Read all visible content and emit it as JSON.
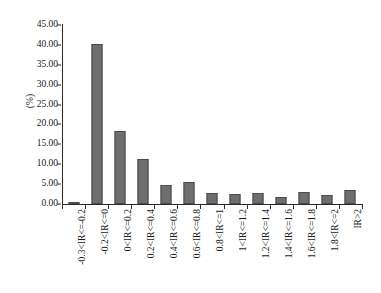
{
  "chart_data": {
    "type": "bar",
    "title": "",
    "subtitle": "",
    "xlabel": "",
    "ylabel": "(%)",
    "ylim": [
      0,
      45
    ],
    "yticks": [
      "0.00",
      "5.00",
      "10.00",
      "15.00",
      "20.00",
      "25.00",
      "30.00",
      "35.00",
      "40.00",
      "45.00"
    ],
    "ytick_values": [
      0,
      5,
      10,
      15,
      20,
      25,
      30,
      35,
      40,
      45
    ],
    "grid": false,
    "legend": "none",
    "bar_color": "#6e6e6e",
    "bar_edge_color": "#4a4a4a",
    "axis_color": "#2b2b2b",
    "categories": [
      "-0.3<IR<=-0.2",
      "-0.2<IR<=0",
      "0<IR<=0.2",
      "0.2<IR<=0.4",
      "0.4<IR<=0.6",
      "0.6<IR<=0.8",
      "0.8<IR<=1",
      "1<IR<=1.2",
      "1.2<IR<=1.4",
      "1.4<IR<=1.6",
      "1.6<IR<=1.8",
      "1.8<IR<=2",
      "IR>2"
    ],
    "values": [
      0.4,
      40.2,
      18.4,
      11.3,
      4.7,
      5.6,
      2.8,
      2.4,
      2.7,
      1.7,
      3.0,
      2.3,
      3.6
    ]
  }
}
